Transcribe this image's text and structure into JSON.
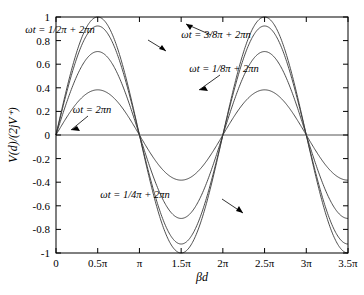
{
  "chart_data": {
    "type": "line",
    "title": "",
    "xlabel": "βd",
    "ylabel": "V(d)/(2jV⁺)",
    "xlim": [
      0,
      10.995574
    ],
    "ylim": [
      -1,
      1
    ],
    "grid": false,
    "legend_position": "inline-annotations",
    "x_tick_labels": [
      "0",
      "0.5π",
      "π",
      "1.5π",
      "2π",
      "2.5π",
      "3π",
      "3.5π"
    ],
    "x_tick_values": [
      0,
      1.5707963,
      3.1415927,
      4.712389,
      6.2831853,
      7.8539816,
      9.424778,
      10.995574
    ],
    "y_tick_labels": [
      "1",
      "0.8",
      "0.6",
      "0.4",
      "0.2",
      "0",
      "-0.2",
      "-0.4",
      "-0.6",
      "-0.8",
      "-1"
    ],
    "y_tick_values": [
      1,
      0.8,
      0.6,
      0.4,
      0.2,
      0,
      -0.2,
      -0.4,
      -0.6,
      -0.8,
      -1
    ],
    "equation": "V(d)/(2jV+) = cos(ωt) · sin(βd)",
    "series": [
      {
        "name": "ωt = 2πn",
        "amplitude": 1.0,
        "peak_value": 1.0,
        "trough_value": -1.0
      },
      {
        "name": "ωt = 1/8π + 2πn",
        "amplitude": 0.9239,
        "peak_value": 0.92,
        "trough_value": -0.92
      },
      {
        "name": "ωt = 1/4π + 2πn",
        "amplitude": 0.7071,
        "peak_value": 0.71,
        "trough_value": -0.71
      },
      {
        "name": "ωt = 3/8π + 2πn",
        "amplitude": 0.3827,
        "peak_value": 0.38,
        "trough_value": -0.38
      },
      {
        "name": "ωt = 1/2π + 2πn",
        "amplitude": 0.0,
        "peak_value": 0.0,
        "trough_value": 0.0
      }
    ],
    "annotations": [
      {
        "id": "annot-half-pi",
        "text": "ωt = 1/2π + 2πn",
        "text_x": 60,
        "text_y": 33,
        "arrow": "down-right"
      },
      {
        "id": "annot-three-eighths-pi",
        "text": "ωt = 3/8π + 2πn",
        "text_x": 216,
        "text_y": 38,
        "arrow": "up-left"
      },
      {
        "id": "annot-one-eighth-pi",
        "text": "ωt = 1/8π + 2πn",
        "text_x": 224,
        "text_y": 72,
        "arrow": "down-left"
      },
      {
        "id": "annot-two-pi-n",
        "text": "ωt = 2πn",
        "text_x": 92,
        "text_y": 113,
        "arrow": "down-left"
      },
      {
        "id": "annot-quarter-pi",
        "text": "ωt = 1/4π + 2πn",
        "text_x": 135,
        "text_y": 198,
        "arrow": "down-right"
      }
    ]
  }
}
